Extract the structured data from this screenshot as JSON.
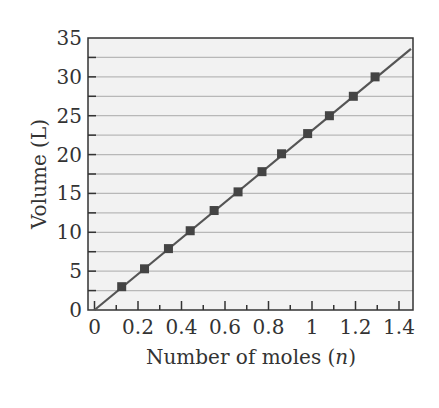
{
  "chart_data": {
    "type": "scatter",
    "title": "",
    "xlabel": "Number of moles (n)",
    "xlabel_parts": {
      "prefix": "Number of moles (",
      "var": "n",
      "suffix": ")"
    },
    "ylabel": "Volume (L)",
    "xlim": [
      0,
      1.5
    ],
    "ylim": [
      0,
      35
    ],
    "x_ticks": [
      0,
      0.2,
      0.4,
      0.6,
      0.8,
      1,
      1.2,
      1.4
    ],
    "x_tick_labels": [
      "0",
      "0.2",
      "0.4",
      "0.6",
      "0.8",
      "1",
      "1.2",
      "1.4"
    ],
    "y_ticks": [
      0,
      5,
      10,
      15,
      20,
      25,
      30,
      35
    ],
    "y_tick_labels": [
      "0",
      "5",
      "10",
      "15",
      "20",
      "25",
      "30",
      "35"
    ],
    "grid": {
      "horizontal": true,
      "step": 2.5
    },
    "legend": null,
    "series": [
      {
        "name": "Measured volume",
        "marker": "square",
        "x": [
          0.125,
          0.23,
          0.34,
          0.44,
          0.55,
          0.66,
          0.77,
          0.86,
          0.98,
          1.08,
          1.19,
          1.29
        ],
        "y": [
          3.0,
          5.3,
          7.9,
          10.2,
          12.8,
          15.2,
          17.8,
          20.1,
          22.7,
          25.0,
          27.5,
          30.0
        ]
      },
      {
        "name": "Linear fit",
        "type": "line",
        "x": [
          0,
          1.455
        ],
        "y": [
          0,
          33.6
        ]
      }
    ]
  },
  "colors": {
    "plot_background": "#f2f2f2",
    "gridline": "#b8b8b8",
    "axis": "#333333",
    "line": "#555555",
    "marker": "#444444"
  }
}
